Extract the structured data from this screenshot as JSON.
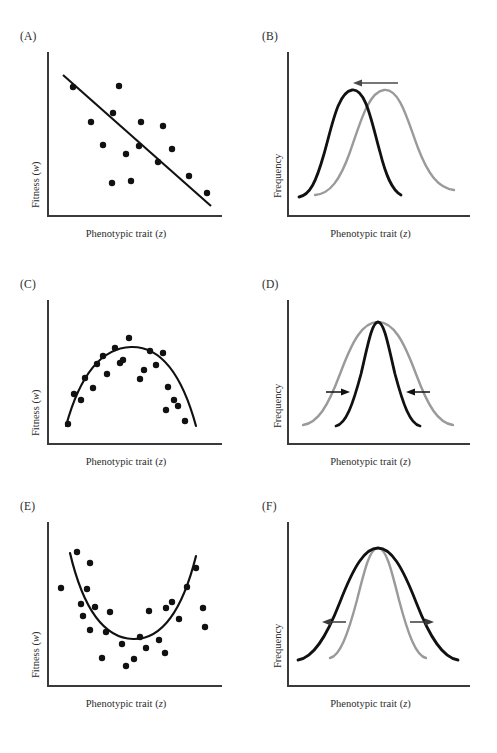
{
  "figure": {
    "background_color": "#ffffff",
    "curve_color_after": "#111111",
    "curve_color_before": "#9a9a9a",
    "axis_color": "#3a3a3a",
    "point_color": "#111111"
  },
  "panels": [
    {
      "id": "A",
      "label": "(A)",
      "x_label": "Phenotypic trait (z)",
      "y_label": "Fitness (w)",
      "type": "scatter-with-line",
      "description": "directional selection fitness function"
    },
    {
      "id": "B",
      "label": "(B)",
      "x_label": "Phenotypic trait (z)",
      "y_label": "Frequency",
      "type": "distribution-pair",
      "description": "directional selection shifts mean left",
      "arrows": [
        "left"
      ]
    },
    {
      "id": "C",
      "label": "(C)",
      "x_label": "Phenotypic trait (z)",
      "y_label": "Fitness (w)",
      "type": "scatter-with-curve",
      "description": "stabilizing selection fitness function"
    },
    {
      "id": "D",
      "label": "(D)",
      "x_label": "Phenotypic trait (z)",
      "y_label": "Frequency",
      "type": "distribution-pair",
      "description": "stabilizing selection narrows variance",
      "arrows": [
        "right-inward",
        "left-inward"
      ]
    },
    {
      "id": "E",
      "label": "(E)",
      "x_label": "Phenotypic trait (z)",
      "y_label": "Fitness (w)",
      "type": "scatter-with-curve",
      "description": "disruptive selection fitness function"
    },
    {
      "id": "F",
      "label": "(F)",
      "x_label": "Phenotypic trait (z)",
      "y_label": "Frequency",
      "type": "distribution-pair",
      "description": "disruptive selection widens variance",
      "arrows": [
        "left-outward",
        "right-outward"
      ]
    }
  ],
  "chart_data": [
    {
      "type": "scatter",
      "panel": "A",
      "title": "",
      "xlabel": "Phenotypic trait (z)",
      "ylabel": "Fitness (w)",
      "xlim": [
        0,
        100
      ],
      "ylim": [
        0,
        100
      ],
      "grid": false,
      "legend": "none",
      "points": [
        [
          14.5,
          78.5
        ],
        [
          41.0,
          79.0
        ],
        [
          24.5,
          57.5
        ],
        [
          37.5,
          63.0
        ],
        [
          53.5,
          57.0
        ],
        [
          66.0,
          54.5
        ],
        [
          31.5,
          44.0
        ],
        [
          52.0,
          43.5
        ],
        [
          71.5,
          42.0
        ],
        [
          44.5,
          38.5
        ],
        [
          63.0,
          34.0
        ],
        [
          47.5,
          23.0
        ],
        [
          36.5,
          21.5
        ],
        [
          81.0,
          26.0
        ],
        [
          91.5,
          16.5
        ]
      ],
      "fit_line": {
        "name": "linear regression",
        "x": [
          9.0,
          94.0
        ],
        "y": [
          86.0,
          9.0
        ],
        "slope_sign": "negative",
        "color": "#111111"
      }
    },
    {
      "type": "line",
      "panel": "B",
      "title": "",
      "xlabel": "Phenotypic trait (z)",
      "ylabel": "Frequency",
      "xlim": [
        0,
        100
      ],
      "ylim": [
        0,
        100
      ],
      "grid": false,
      "legend": "none",
      "series": [
        {
          "name": "before selection",
          "color": "#9a9a9a",
          "mean": 56,
          "sd": 15,
          "peak": 88
        },
        {
          "name": "after selection",
          "color": "#111111",
          "mean": 38,
          "sd": 12,
          "peak": 88
        }
      ],
      "annotations": [
        {
          "kind": "arrow",
          "direction": "left",
          "x_from": 52,
          "x_to": 36,
          "y": 92
        }
      ]
    },
    {
      "type": "scatter",
      "panel": "C",
      "title": "",
      "xlabel": "Phenotypic trait (z)",
      "ylabel": "Fitness (w)",
      "xlim": [
        0,
        100
      ],
      "ylim": [
        0,
        100
      ],
      "grid": false,
      "legend": "none",
      "points": [
        [
          14.0,
          12.0
        ],
        [
          17.5,
          34.0
        ],
        [
          24.0,
          46.0
        ],
        [
          21.5,
          30.0
        ],
        [
          28.5,
          39.0
        ],
        [
          31.0,
          56.0
        ],
        [
          34.5,
          62.0
        ],
        [
          37.0,
          48.0
        ],
        [
          41.5,
          67.0
        ],
        [
          44.5,
          55.0
        ],
        [
          50.0,
          74.0
        ],
        [
          46.5,
          58.5
        ],
        [
          56.5,
          45.0
        ],
        [
          59.0,
          52.0
        ],
        [
          62.5,
          66.0
        ],
        [
          66.0,
          56.0
        ],
        [
          70.5,
          65.0
        ],
        [
          73.5,
          40.0
        ],
        [
          77.0,
          31.0
        ],
        [
          79.5,
          26.5
        ],
        [
          83.5,
          16.0
        ],
        [
          72.0,
          24.0
        ]
      ],
      "fit_curve": {
        "name": "quadratic fit",
        "shape": "concave-down",
        "vertex_x": 50,
        "vertex_y": 68,
        "color": "#111111"
      }
    },
    {
      "type": "line",
      "panel": "D",
      "title": "",
      "xlabel": "Phenotypic trait (z)",
      "ylabel": "Frequency",
      "xlim": [
        0,
        100
      ],
      "ylim": [
        0,
        100
      ],
      "grid": false,
      "legend": "none",
      "series": [
        {
          "name": "before selection",
          "color": "#9a9a9a",
          "mean": 50,
          "sd": 18,
          "peak": 84
        },
        {
          "name": "after selection",
          "color": "#111111",
          "mean": 50,
          "sd": 11,
          "peak": 84
        }
      ],
      "annotations": [
        {
          "kind": "arrow",
          "direction": "right",
          "x_from": 25,
          "x_to": 33,
          "y": 28
        },
        {
          "kind": "arrow",
          "direction": "left",
          "x_from": 76,
          "x_to": 67,
          "y": 28
        }
      ]
    },
    {
      "type": "scatter",
      "panel": "E",
      "title": "",
      "xlabel": "Phenotypic trait (z)",
      "ylabel": "Fitness (w)",
      "xlim": [
        0,
        100
      ],
      "ylim": [
        0,
        100
      ],
      "grid": false,
      "legend": "none",
      "points": [
        [
          16.5,
          80.0
        ],
        [
          24.0,
          73.5
        ],
        [
          7.5,
          58.0
        ],
        [
          22.5,
          57.5
        ],
        [
          19.0,
          48.0
        ],
        [
          27.0,
          47.0
        ],
        [
          20.5,
          41.5
        ],
        [
          24.5,
          32.5
        ],
        [
          36.0,
          43.5
        ],
        [
          33.5,
          31.5
        ],
        [
          42.5,
          24.0
        ],
        [
          31.0,
          15.5
        ],
        [
          45.0,
          10.5
        ],
        [
          52.5,
          30.0
        ],
        [
          49.5,
          15.0
        ],
        [
          57.5,
          46.5
        ],
        [
          63.0,
          27.5
        ],
        [
          67.0,
          48.0
        ],
        [
          70.5,
          52.0
        ],
        [
          66.5,
          18.0
        ],
        [
          74.5,
          41.0
        ],
        [
          79.0,
          60.0
        ],
        [
          84.5,
          72.0
        ],
        [
          88.5,
          48.0
        ],
        [
          90.0,
          35.0
        ],
        [
          56.0,
          23.5
        ]
      ],
      "fit_curve": {
        "name": "quadratic fit",
        "shape": "concave-up",
        "vertex_x": 52,
        "vertex_y": 22,
        "color": "#111111"
      }
    },
    {
      "type": "line",
      "panel": "F",
      "title": "",
      "xlabel": "Phenotypic trait (z)",
      "ylabel": "Frequency",
      "xlim": [
        0,
        100
      ],
      "ylim": [
        0,
        100
      ],
      "grid": false,
      "legend": "none",
      "series": [
        {
          "name": "before selection",
          "color": "#9a9a9a",
          "mean": 50,
          "sd": 11,
          "peak": 84
        },
        {
          "name": "after selection",
          "color": "#111111",
          "mean": 50,
          "sd": 17,
          "peak": 84
        }
      ],
      "annotations": [
        {
          "kind": "arrow",
          "direction": "left",
          "x_from": 33,
          "x_to": 23,
          "y": 30
        },
        {
          "kind": "arrow",
          "direction": "right",
          "x_from": 67,
          "x_to": 78,
          "y": 30
        }
      ]
    }
  ]
}
